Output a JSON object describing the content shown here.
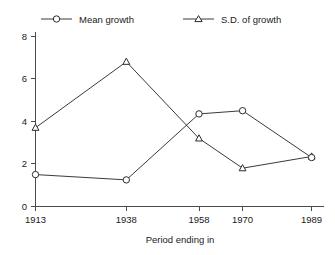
{
  "chart_data": {
    "type": "line",
    "title": "",
    "subtitle": "",
    "xlabel": "Period ending in",
    "ylabel": "",
    "x": [
      1913,
      1938,
      1958,
      1970,
      1989
    ],
    "categories": [
      "1913",
      "1938",
      "1958",
      "1970",
      "1989"
    ],
    "xtick_labels": [
      "1913",
      "1938",
      "1958",
      "1970",
      "1989"
    ],
    "ytick_labels": [
      "0",
      "2",
      "4",
      "6",
      "8"
    ],
    "yticks": [
      0,
      2,
      4,
      6,
      8
    ],
    "ylim": [
      0,
      8
    ],
    "xlim": [
      1913,
      1989
    ],
    "x_scale": "linear-years",
    "grid": false,
    "legend_position": "top",
    "series": [
      {
        "name": "Mean growth",
        "marker": "circle",
        "values": [
          1.5,
          1.25,
          4.35,
          4.5,
          2.3
        ]
      },
      {
        "name": "S.D. of growth",
        "marker": "triangle",
        "values": [
          3.7,
          6.8,
          3.2,
          1.8,
          2.35
        ]
      }
    ],
    "colors": {
      "line": "#3a3a3a",
      "marker_fill": "#ffffff",
      "marker_stroke": "#2b2b2b",
      "axis": "#4a4a4a",
      "text": "#1a1a1a",
      "background": "#ffffff"
    }
  },
  "legend": {
    "entries": [
      {
        "label": "Mean growth",
        "marker": "circle"
      },
      {
        "label": "S.D. of growth",
        "marker": "triangle"
      }
    ]
  },
  "axes": {
    "x_title": "Period ending in",
    "y_title": ""
  }
}
